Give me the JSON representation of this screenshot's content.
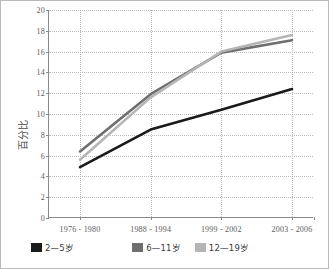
{
  "chart_data": {
    "type": "line",
    "title": "",
    "xlabel": "",
    "ylabel": "百分比",
    "categories": [
      "1976 - 1980",
      "1988 - 1994",
      "1999 - 2002",
      "2003 - 2006"
    ],
    "ylim": [
      0,
      20
    ],
    "ytick_step": 2,
    "yticks": [
      "0",
      "2",
      "4",
      "6",
      "8",
      "10",
      "12",
      "14",
      "16",
      "18",
      "20"
    ],
    "grid": true,
    "legend_position": "bottom-left",
    "series": [
      {
        "name": "2—5岁",
        "color": "#1a1a1a",
        "values": [
          4.9,
          8.5,
          10.4,
          12.4
        ]
      },
      {
        "name": "6—11岁",
        "color": "#6e6e6e",
        "values": [
          6.4,
          11.9,
          15.9,
          17.1
        ]
      },
      {
        "name": "12—19岁",
        "color": "#b5b5b5",
        "values": [
          5.6,
          11.6,
          16.0,
          17.6
        ]
      }
    ]
  },
  "axis": {
    "y_title": "百分比"
  },
  "legend": {
    "items": [
      {
        "label": "2—5岁",
        "swatch": "legend-swatch-dark"
      },
      {
        "label": "6—11岁",
        "swatch": "legend-swatch-mid"
      },
      {
        "label": "12—19岁",
        "swatch": "legend-swatch-light"
      }
    ]
  },
  "colors": {
    "series_dark": "#1a1a1a",
    "series_mid": "#6e6e6e",
    "series_light": "#b5b5b5",
    "axis": "#8a8a8a",
    "grid": "#bdbdbd",
    "frame": "#b9b9b9",
    "text": "#5b5b5b"
  }
}
